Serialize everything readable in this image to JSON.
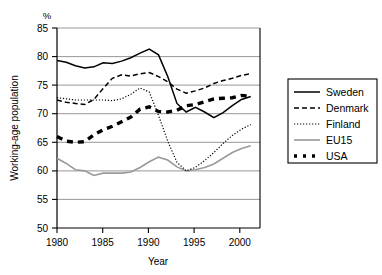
{
  "chart_data": {
    "type": "line",
    "title": "",
    "xlabel": "Year",
    "ylabel": "Working-age population",
    "unit_label": "%",
    "xlim": [
      1980,
      2002
    ],
    "ylim": [
      50,
      85
    ],
    "xticks": [
      1980,
      1985,
      1990,
      1995,
      2000
    ],
    "yticks": [
      50,
      55,
      60,
      65,
      70,
      75,
      80,
      85
    ],
    "grid": "horizontal",
    "legend_position": "right-outside",
    "x": [
      1980,
      1981,
      1982,
      1983,
      1984,
      1985,
      1986,
      1987,
      1988,
      1989,
      1990,
      1991,
      1992,
      1993,
      1994,
      1995,
      1996,
      1997,
      1998,
      1999,
      2000,
      2001
    ],
    "series": [
      {
        "name": "Sweden",
        "style": "solid",
        "color": "#000000",
        "values": [
          79.3,
          79.0,
          78.4,
          78.0,
          78.2,
          78.9,
          78.8,
          79.2,
          79.8,
          80.6,
          81.3,
          80.3,
          76.5,
          71.8,
          70.3,
          71.1,
          70.3,
          69.3,
          70.2,
          71.4,
          72.5,
          73.0
        ]
      },
      {
        "name": "Denmark",
        "style": "dashed",
        "color": "#000000",
        "values": [
          72.4,
          72.0,
          71.8,
          71.6,
          72.5,
          74.4,
          76.2,
          76.8,
          76.6,
          77.0,
          77.2,
          76.5,
          75.6,
          74.3,
          73.6,
          74.0,
          74.5,
          75.3,
          75.8,
          76.2,
          76.7,
          77.0
        ]
      },
      {
        "name": "Finland",
        "style": "dotted",
        "color": "#000000",
        "values": [
          72.8,
          72.6,
          72.4,
          72.4,
          72.4,
          72.4,
          72.3,
          72.6,
          73.4,
          74.5,
          73.8,
          69.7,
          65.2,
          61.5,
          60.0,
          60.6,
          61.8,
          63.2,
          64.8,
          66.2,
          67.3,
          68.1
        ]
      },
      {
        "name": "EU15",
        "style": "solid-gray",
        "color": "#9a9a9a",
        "values": [
          62.2,
          61.3,
          60.2,
          60.0,
          59.2,
          59.6,
          59.6,
          59.6,
          59.8,
          60.6,
          61.6,
          62.4,
          61.9,
          60.7,
          60.0,
          60.2,
          60.6,
          61.2,
          62.2,
          63.2,
          63.9,
          64.4
        ]
      },
      {
        "name": "USA",
        "style": "thick-dashed",
        "color": "#000000",
        "values": [
          66.0,
          65.2,
          65.0,
          65.1,
          66.3,
          67.2,
          67.8,
          68.6,
          69.4,
          70.8,
          71.2,
          70.4,
          70.3,
          70.6,
          71.4,
          71.6,
          72.1,
          72.6,
          72.7,
          72.8,
          73.2,
          73.0
        ]
      }
    ]
  },
  "legend": {
    "items": [
      {
        "label": "Sweden"
      },
      {
        "label": "Denmark"
      },
      {
        "label": "Finland"
      },
      {
        "label": "EU15"
      },
      {
        "label": "USA"
      }
    ]
  },
  "axis": {
    "y_unit": "%",
    "y_title": "Working-age population",
    "x_title": "Year",
    "y_tick_labels": [
      "85",
      "80",
      "75",
      "70",
      "65",
      "60",
      "55",
      "50"
    ],
    "x_tick_labels": [
      "1980",
      "1985",
      "1990",
      "1995",
      "2000"
    ]
  }
}
